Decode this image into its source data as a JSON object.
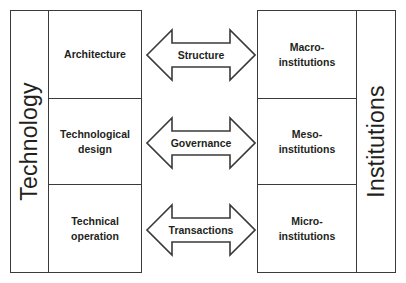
{
  "diagram": {
    "background_color": "#ffffff",
    "line_color": "#3a3a3a",
    "text_color": "#231f20"
  },
  "left_column": {
    "label": "Technology",
    "cells": [
      {
        "label": "Architecture"
      },
      {
        "label": "Technological\ndesign",
        "line1": "Technological",
        "line2": "design"
      },
      {
        "label": "Technical\noperation",
        "line1": "Technical",
        "line2": "operation"
      }
    ]
  },
  "right_column": {
    "label": "Institutions",
    "cells": [
      {
        "label": "Macro-\ninstitutions",
        "line1": "Macro-",
        "line2": "institutions"
      },
      {
        "label": "Meso-\ninstitutions",
        "line1": "Meso-",
        "line2": "institutions"
      },
      {
        "label": "Micro-\ninstitutions",
        "line1": "Micro-",
        "line2": "institutions"
      }
    ]
  },
  "connectors": [
    {
      "label": "Structure",
      "icon": "double-arrow-horizontal-icon"
    },
    {
      "label": "Governance",
      "icon": "double-arrow-horizontal-icon"
    },
    {
      "label": "Transactions",
      "icon": "double-arrow-horizontal-icon"
    }
  ]
}
